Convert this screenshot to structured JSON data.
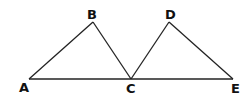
{
  "diagram": {
    "points": {
      "A": {
        "label": "A",
        "x": 29,
        "y": 79
      },
      "B": {
        "label": "B",
        "x": 93,
        "y": 22
      },
      "C": {
        "label": "C",
        "x": 131,
        "y": 79
      },
      "D": {
        "label": "D",
        "x": 169,
        "y": 22
      },
      "E": {
        "label": "E",
        "x": 233,
        "y": 79
      }
    },
    "segments": [
      [
        "A",
        "B"
      ],
      [
        "B",
        "C"
      ],
      [
        "C",
        "D"
      ],
      [
        "D",
        "E"
      ],
      [
        "A",
        "E"
      ]
    ],
    "line_color": "#222222"
  }
}
